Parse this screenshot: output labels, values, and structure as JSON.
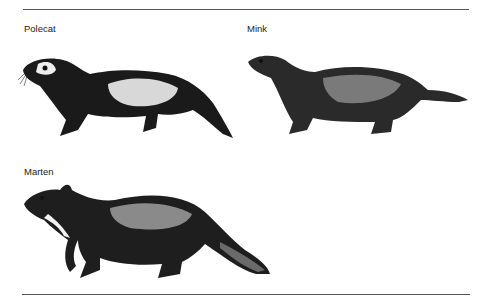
{
  "figure": {
    "panels": [
      {
        "label": "Polecat",
        "illustration": "polecat-drawing"
      },
      {
        "label": "Mink",
        "illustration": "mink-drawing"
      },
      {
        "label": "Marten",
        "illustration": "marten-drawing"
      }
    ]
  },
  "colors": {
    "ink": "#1a1a1a",
    "rule": "#555555",
    "background": "#ffffff"
  }
}
